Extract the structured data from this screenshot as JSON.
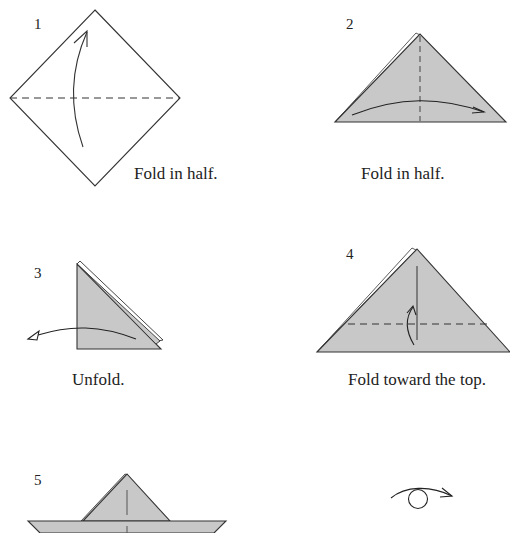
{
  "colors": {
    "paper_fill": "#c8c8c8",
    "line": "#333333",
    "background": "#ffffff"
  },
  "steps": [
    {
      "number": "1",
      "caption": "Fold in half."
    },
    {
      "number": "2",
      "caption": "Fold in half."
    },
    {
      "number": "3",
      "caption": "Unfold."
    },
    {
      "number": "4",
      "caption": "Fold toward the top."
    },
    {
      "number": "5",
      "caption": ""
    }
  ],
  "symbols": {
    "turn_over": "turn-over-symbol"
  }
}
